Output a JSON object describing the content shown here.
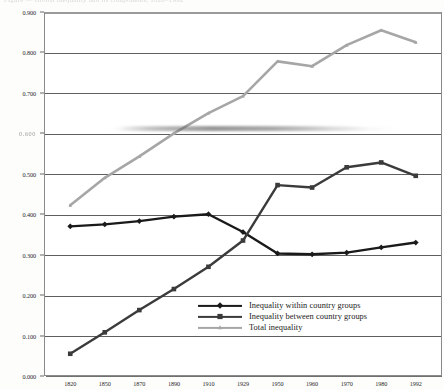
{
  "page": {
    "ghost_title": "Figure — Global inequality and its components, 1820–1992"
  },
  "chart_data": {
    "type": "line",
    "title": "",
    "xlabel": "",
    "ylabel": "",
    "grid": true,
    "legend_position": "inside-bottom-right",
    "categories": [
      "1820",
      "1850",
      "1870",
      "1890",
      "1910",
      "1929",
      "1950",
      "1960",
      "1970",
      "1980",
      "1992"
    ],
    "x": [
      1820,
      1850,
      1870,
      1890,
      1910,
      1929,
      1950,
      1960,
      1970,
      1980,
      1992
    ],
    "ylim": [
      0.0,
      0.9
    ],
    "ytick_labels": [
      "0.000",
      "0.100",
      "0.200",
      "0.300",
      "0.400",
      "0.500",
      "0.600",
      "0.700",
      "0.800",
      "0.900"
    ],
    "ytick_values": [
      0.0,
      0.1,
      0.2,
      0.3,
      0.4,
      0.5,
      0.6,
      0.7,
      0.8,
      0.9
    ],
    "ytick_degraded": [
      "0.600"
    ],
    "series": [
      {
        "name": "Inequality within country groups",
        "color": "#1a1a1a",
        "marker": "diamond",
        "values": [
          0.37,
          0.375,
          0.383,
          0.394,
          0.4,
          0.356,
          0.303,
          0.301,
          0.305,
          0.318,
          0.33
        ]
      },
      {
        "name": "Inequality between country groups",
        "color": "#3b3b3b",
        "marker": "square",
        "values": [
          0.055,
          0.108,
          0.163,
          0.215,
          0.27,
          0.335,
          0.472,
          0.466,
          0.516,
          0.528,
          0.495
        ]
      },
      {
        "name": "Total inequality",
        "color": "#a6a6a6",
        "marker": "triangle",
        "values": [
          0.422,
          0.49,
          0.543,
          0.6,
          0.65,
          0.692,
          0.778,
          0.766,
          0.818,
          0.855,
          0.825
        ]
      }
    ]
  },
  "legend": {
    "items": [
      {
        "label": "Inequality within country groups",
        "color": "#1a1a1a",
        "marker": "diamond"
      },
      {
        "label": "Inequality between country groups",
        "color": "#3b3b3b",
        "marker": "square"
      },
      {
        "label": "Total inequality",
        "color": "#a6a6a6",
        "marker": "triangle"
      }
    ]
  }
}
